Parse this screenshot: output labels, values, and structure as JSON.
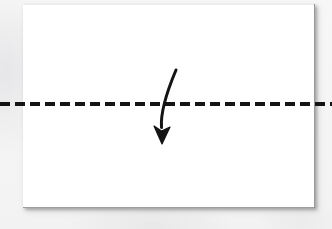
{
  "canvas": {
    "width": 332,
    "height": 229,
    "background_color": "#f4f4f4",
    "description": "Origami-style instruction diagram: a blank white rectangular sheet with a horizontal dashed fold line and a curved arrow indicating a downward fold."
  },
  "card": {
    "name": "paper-sheet",
    "fill_color": "#ffffff",
    "border_color": "#8a8a8a",
    "shadow_color": "#787878",
    "x": 23,
    "y": 4,
    "width": 292,
    "height": 204
  },
  "fold_line": {
    "label": "valley-fold-line",
    "style": "dashed",
    "color": "#141414",
    "stroke_width": 4,
    "dash_length": 10,
    "gap_length": 5,
    "y": 104,
    "x_start": 0,
    "x_end": 332
  },
  "fold_arrow": {
    "label": "fold-direction-arrow",
    "color": "#141414",
    "direction": "down",
    "stroke_width": 3,
    "start_x": 176,
    "start_y": 70,
    "end_x": 162,
    "end_y": 144,
    "control_x": 160,
    "control_y": 108,
    "arrowhead_width": 16,
    "arrowhead_length": 18
  },
  "chart_data": {
    "type": "diagram",
    "title": "",
    "elements": [
      {
        "name": "paper-sheet",
        "shape": "rectangle",
        "x": 23,
        "y": 4,
        "width": 292,
        "height": 204,
        "fill": "#ffffff"
      },
      {
        "name": "valley-fold-line",
        "shape": "dashed-line",
        "y": 104,
        "x_start": 0,
        "x_end": 332,
        "color": "#141414"
      },
      {
        "name": "fold-direction-arrow",
        "shape": "curved-arrow",
        "from": [
          176,
          70
        ],
        "to": [
          162,
          144
        ],
        "color": "#141414"
      }
    ]
  }
}
